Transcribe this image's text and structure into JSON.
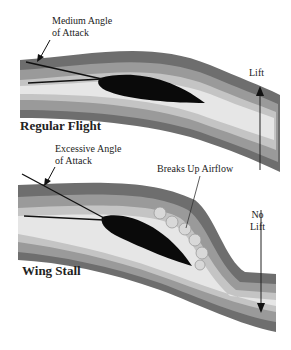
{
  "top_panel": {
    "annotation_line1": "Medium Angle",
    "annotation_line2": "of Attack",
    "force_label": "Lift",
    "title": "Regular Flight"
  },
  "bottom_panel": {
    "annotation_line1": "Excessive Angle",
    "annotation_line2": "of Attack",
    "turbulence_label": "Breaks Up Airflow",
    "force_label_line1": "No",
    "force_label_line2": "Lift",
    "title": "Wing Stall"
  },
  "colors": {
    "band_dark": "#6e6e6e",
    "band_mid": "#9a9a9a",
    "band_light": "#c4c4c4",
    "band_core": "#e6e6e6",
    "wing": "#0a0a0a"
  }
}
